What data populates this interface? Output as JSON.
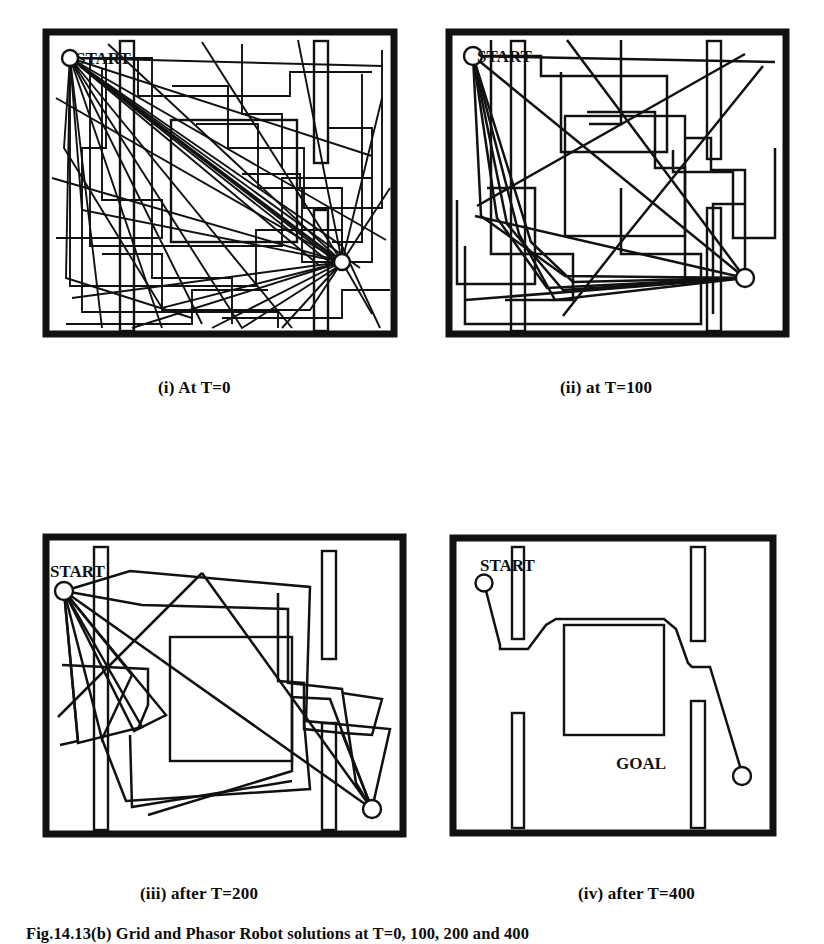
{
  "figure": {
    "caption": "Fig.14.13(b)  Grid and Phasor Robot solutions at T=0, 100, 200 and 400",
    "panel_count": 4,
    "layout": "2x2 grid"
  },
  "panels": [
    {
      "id": "i",
      "caption": "(i) At T=0",
      "generation": 0,
      "start_label": "START",
      "goal_label": "",
      "path_count": 30,
      "description": "dense tangle of unoptimised candidate paths from start to goal"
    },
    {
      "id": "ii",
      "caption": "(ii) at T=100",
      "generation": 100,
      "start_label": "START",
      "goal_label": "",
      "path_count": 14,
      "description": "population partly converged, fewer crossing paths"
    },
    {
      "id": "iii",
      "caption": "(iii) after T=200",
      "generation": 200,
      "start_label": "START",
      "goal_label": "",
      "path_count": 6,
      "description": "near convergence, several smooth obstacle-avoiding routes"
    },
    {
      "id": "iv",
      "caption": "(iv) after T=400",
      "generation": 400,
      "start_label": "START",
      "goal_label": "GOAL",
      "path_count": 1,
      "description": "single converged collision-free path from start to goal"
    }
  ],
  "colors": {
    "ink": "#111111",
    "background": "#ffffff",
    "frame": "#111111"
  },
  "environment": {
    "obstacles": [
      "central-square-block",
      "left-vertical-bar",
      "right-upper-vertical-bar",
      "right-lower-vertical-bar"
    ],
    "start_position": "top-left",
    "goal_position": "bottom-right"
  }
}
